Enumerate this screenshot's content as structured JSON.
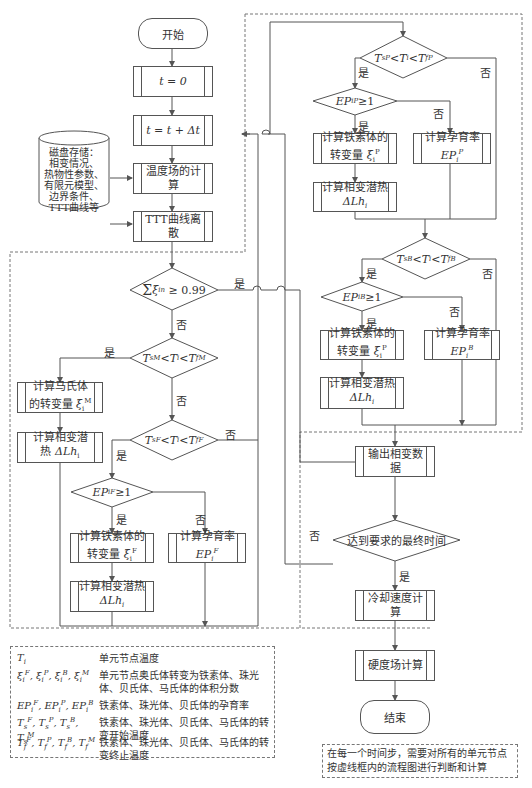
{
  "figure": {
    "type": "flowchart"
  },
  "nodes": {
    "start": "开始",
    "t_init": "t = 0",
    "t_step": "t = t + Δt",
    "disk_storage": [
      "磁盘存储：",
      "相变情况、",
      "热物性参数、",
      "有限元模型、",
      "边界条件、",
      "TTT曲线等"
    ],
    "temp_field": "温度场的计算",
    "ttt_discrete": "TTT曲线离散",
    "sum_check": "Σ(n=1..4) ξiⁿ ≥ 0.99",
    "martensite_check": "TsM < Ti < TfM",
    "calc_martensite": [
      "计算马氏体",
      "的转变量 ξiM"
    ],
    "calc_latent_m": [
      "计算相变潜",
      "热 ΔLhi"
    ],
    "ferrite_check": "TsF < Ti < TfF",
    "ep_f_check": "EPiF ≥ 1",
    "calc_ferrite_f": [
      "计算铁素体的",
      "转变量 ξiF"
    ],
    "calc_incub_f": [
      "计算孕育率",
      "EPiF"
    ],
    "calc_latent_f": [
      "计算相变潜热",
      "ΔLhi"
    ],
    "pearlite_check": "TsP < Ti < TfP",
    "ep_p_check": "EPiP ≥ 1",
    "calc_ferrite_p": [
      "计算铁素体的",
      "转变量 ξiP"
    ],
    "calc_incub_p": [
      "计算孕育率",
      "EPiP"
    ],
    "calc_latent_p": [
      "计算相变潜热",
      "ΔLhi"
    ],
    "bainite_check": "TsB < Ti < TfB",
    "ep_b_check": "EPiB ≥ 1",
    "calc_ferrite_b": [
      "计算铁素体的",
      "转变量 ξiP"
    ],
    "calc_incub_b": [
      "计算孕育率",
      "EPiB"
    ],
    "calc_latent_b": [
      "计算相变潜热",
      "ΔLhi"
    ],
    "output_phase": "输出相变数据",
    "final_time_check": "达到要求的最终时间",
    "cooling_rate": "冷却速度计算",
    "hardness": "硬度场计算",
    "end": "结束"
  },
  "branch_labels": {
    "yes": "是",
    "no": "否"
  },
  "legend": [
    {
      "symbol": "Ti",
      "desc": "单元节点温度"
    },
    {
      "symbol": "ξiF, ξiP, ξiB, ξiM",
      "desc": "单元节点奥氏体转变为铁素体、珠光体、贝氏体、马氏体的体积分数"
    },
    {
      "symbol": "EPiF, EPiP, EPiB",
      "desc": "铁素体、珠光体、贝氏体的孕育率"
    },
    {
      "symbol": "TsF, TsP, TsB, TsM",
      "desc": "铁素体、珠光体、贝氏体、马氏体的转变开始温度"
    },
    {
      "symbol": "TfF, TfP, TfB, TfM",
      "desc": "铁素体、珠光体、贝氏体、马氏体的转变终止温度"
    }
  ],
  "note": "在每一个时间步，需要对所有的单元节点按虚线框内的流程图进行判断和计算"
}
